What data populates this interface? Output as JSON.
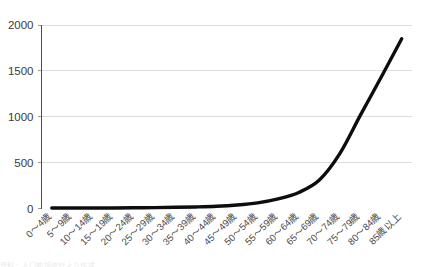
{
  "chart_data": {
    "type": "line",
    "title": "",
    "subtitle": "",
    "xlabel": "",
    "ylabel": "",
    "categories": [
      "0～4歳",
      "5～9歳",
      "10～14歳",
      "15～19歳",
      "20～24歳",
      "25～29歳",
      "30～34歳",
      "35～39歳",
      "40～44歳",
      "45～49歳",
      "50～54歳",
      "55～59歳",
      "60～64歳",
      "65～69歳",
      "70～74歳",
      "75～79歳",
      "80～84歳",
      "85歳以上"
    ],
    "values": [
      5,
      5,
      5,
      6,
      8,
      10,
      13,
      17,
      24,
      38,
      62,
      105,
      175,
      310,
      600,
      1020,
      1430,
      1850
    ],
    "series": [
      {
        "name": "",
        "values": [
          5,
          5,
          5,
          6,
          8,
          10,
          13,
          17,
          24,
          38,
          62,
          105,
          175,
          310,
          600,
          1020,
          1430,
          1850
        ],
        "color": "#0d0d0d"
      }
    ],
    "yticks": [
      0,
      500,
      1000,
      1500,
      2000
    ],
    "ytick_labels": [
      "0",
      "500",
      "1000",
      "1500",
      "2000"
    ],
    "ylim": [
      0,
      2000
    ],
    "grid": true,
    "legend": false,
    "legend_position": "none",
    "gridline_color": "#dcdcdc",
    "axis_color": "#4d4d4d",
    "line_color": "#0d0d0d",
    "background": "#ffffff"
  },
  "footer": {
    "smudge_text": "資料：人口動態統計より作成"
  }
}
